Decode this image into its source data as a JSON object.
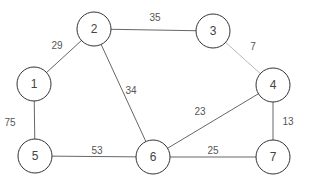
{
  "graph": {
    "type": "weighted-undirected-graph",
    "nodes": [
      {
        "id": "1",
        "label": "1",
        "x": 34,
        "y": 84,
        "r": 17
      },
      {
        "id": "2",
        "label": "2",
        "x": 94,
        "y": 29,
        "r": 17
      },
      {
        "id": "3",
        "label": "3",
        "x": 213,
        "y": 31,
        "r": 17
      },
      {
        "id": "4",
        "label": "4",
        "x": 273,
        "y": 85,
        "r": 17
      },
      {
        "id": "5",
        "label": "5",
        "x": 35,
        "y": 156,
        "r": 17
      },
      {
        "id": "6",
        "label": "6",
        "x": 153,
        "y": 157,
        "r": 17
      },
      {
        "id": "7",
        "label": "7",
        "x": 273,
        "y": 157,
        "r": 17
      }
    ],
    "edges": [
      {
        "from": "1",
        "to": "2",
        "weight": "29",
        "label_x": 57,
        "label_y": 45,
        "light": false
      },
      {
        "from": "2",
        "to": "3",
        "weight": "35",
        "label_x": 155,
        "label_y": 17,
        "light": false
      },
      {
        "from": "2",
        "to": "6",
        "weight": "34",
        "label_x": 131,
        "label_y": 90,
        "light": false
      },
      {
        "from": "3",
        "to": "4",
        "weight": "7",
        "label_x": 253,
        "label_y": 46,
        "light": true
      },
      {
        "from": "1",
        "to": "5",
        "weight": "75",
        "label_x": 10,
        "label_y": 122,
        "light": false
      },
      {
        "from": "4",
        "to": "6",
        "weight": "23",
        "label_x": 200,
        "label_y": 111,
        "light": false
      },
      {
        "from": "4",
        "to": "7",
        "weight": "13",
        "label_x": 288,
        "label_y": 121,
        "light": false
      },
      {
        "from": "5",
        "to": "6",
        "weight": "53",
        "label_x": 97,
        "label_y": 150,
        "light": false
      },
      {
        "from": "6",
        "to": "7",
        "weight": "25",
        "label_x": 213,
        "label_y": 150,
        "light": false
      }
    ]
  },
  "colors": {
    "edge": "#555555",
    "edge_light": "#b0b0b0",
    "node_stroke": "#333333",
    "text": "#444444"
  }
}
